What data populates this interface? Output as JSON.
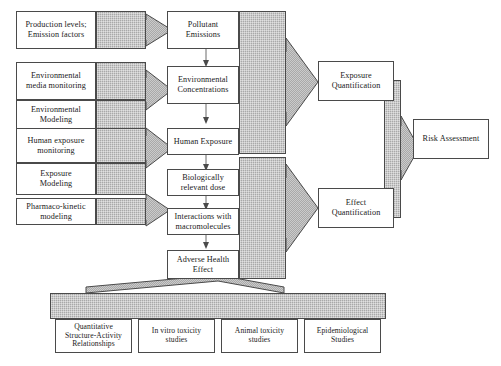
{
  "diagram": {
    "colors": {
      "hatch_fill": "#a9a9a9",
      "box_border": "#4a4a4a",
      "box_fill": "#ffffff",
      "connector": "#6a6a6a",
      "background": "#ffffff"
    },
    "inputs": [
      {
        "id": "production",
        "label": "Production levels;\nEmission factors"
      },
      {
        "id": "env-media",
        "label": "Environmental\nmedia monitoring"
      },
      {
        "id": "env-modeling",
        "label": "Environmental\nModeling"
      },
      {
        "id": "human-exp-mon",
        "label": "Human exposure\nmonitoring"
      },
      {
        "id": "exp-modeling",
        "label": "Exposure\nModeling"
      },
      {
        "id": "pk-modeling",
        "label": "Pharmaco-kinetic\nmodeling"
      }
    ],
    "chain": [
      {
        "id": "pollutant-emissions",
        "label": "Pollutant\nEmissions"
      },
      {
        "id": "env-concentrations",
        "label": "Environmental\nConcentrations"
      },
      {
        "id": "human-exposure",
        "label": "Human Exposure"
      },
      {
        "id": "bio-relevant-dose",
        "label": "Biologically\nrelevant dose"
      },
      {
        "id": "interactions-macro",
        "label": "Interactions with\nmacromolecules"
      },
      {
        "id": "adverse-health",
        "label": "Adverse Health\nEffect"
      }
    ],
    "quantification": [
      {
        "id": "exposure-quant",
        "label": "Exposure\nQuantification"
      },
      {
        "id": "effect-quant",
        "label": "Effect\nQuantification"
      }
    ],
    "outcome": {
      "id": "risk-assessment",
      "label": "Risk Assessment"
    },
    "evidence": [
      {
        "id": "qsar",
        "label": "Quantitative\nStructure-Activity\nRelationships"
      },
      {
        "id": "in-vitro",
        "label": "In vitro toxicity\nstudies"
      },
      {
        "id": "animal-tox",
        "label": "Animal toxicity\nstudies"
      },
      {
        "id": "epidemiological",
        "label": "Epidemiological\nStudies"
      }
    ]
  }
}
